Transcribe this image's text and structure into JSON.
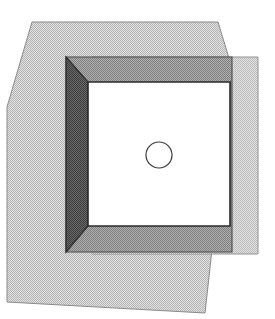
{
  "canvas": {
    "width": 275,
    "height": 319,
    "background": "#ffffff",
    "title": "Overlapping translucent polygons over a shaded cube"
  },
  "palette": {
    "paper_white": "#ffffff",
    "outline_dark": "#2b2b2b",
    "outline_mid": "#6a6a6a",
    "light_gray": "#cfcfcf",
    "light_gray_overlap": "#bdbdbd",
    "medium_gray": "#9a9a9a",
    "medium_gray_overlap": "#8a8a8a",
    "dark_gray": "#545454",
    "cube_face_white": "#ffffff"
  },
  "shapes": {
    "big_quad": {
      "name": "large-light-quadrilateral",
      "fill": "#cfcfcf",
      "stroke": "#7a7a7a",
      "opacity": 1,
      "points": "32,22 218,22 232,68 205,313 7,302 7,107"
    },
    "side_rect": {
      "name": "light-gray-rectangle",
      "fill": "#cfcfcf",
      "stroke": "#7a7a7a",
      "opacity": 1,
      "points": "92,57 258,57 258,254 92,254"
    },
    "cube_back_rect": {
      "name": "cube-shaded-back-rectangle",
      "fill": "#9a9a9a",
      "stroke": "#4a4a4a",
      "opacity": 1,
      "points": "66,57 232,57 232,252 66,252"
    },
    "cube_left_face": {
      "name": "cube-left-side-face",
      "fill": "#545454",
      "stroke": "#2b2b2b",
      "opacity": 1,
      "points": "66,57 88,82 88,226 66,252"
    },
    "cube_front_face": {
      "name": "cube-front-face",
      "fill": "#ffffff",
      "stroke": "#2b2b2b",
      "opacity": 1,
      "points": "88,82 230,82 230,226 88,226"
    },
    "circle": {
      "name": "circle-hole",
      "cx": 159,
      "cy": 155,
      "r": 13,
      "fill": "none",
      "stroke": "#3a3a3a",
      "stroke_width": 1.2
    }
  },
  "overlaps": [
    {
      "name": "quad-rect-overlap-top",
      "fill": "#bdbdbd",
      "points": "92,57 218,57 223,68 92,68"
    },
    {
      "name": "quad-rect-overlap-body",
      "fill": "#bdbdbd",
      "points": "92,68 223,68 210,254 92,254"
    }
  ],
  "annotations": {
    "shape_count": 5,
    "visible_text": ""
  }
}
